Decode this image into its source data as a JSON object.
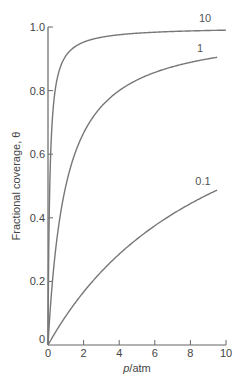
{
  "chart_data": {
    "type": "line",
    "title": "",
    "xlabel": "p/atm",
    "xlabel_italic_part": "p",
    "xlabel_rest": "/atm",
    "ylabel": "Fractional coverage, θ",
    "xlim": [
      0,
      10
    ],
    "ylim": [
      0,
      1.0
    ],
    "grid": false,
    "legend": "inline curve labels",
    "x_ticks": [
      0,
      2,
      4,
      6,
      8,
      10
    ],
    "x_tick_labels": [
      "0",
      "2",
      "4",
      "6",
      "8",
      "10"
    ],
    "y_ticks": [
      0,
      0.2,
      0.4,
      0.6,
      0.8,
      1.0
    ],
    "y_tick_labels": [
      "0",
      "0.2",
      "0.4",
      "0.6",
      "0.8",
      "1.0"
    ],
    "model": "theta = K*p/(1+K*p)",
    "series": [
      {
        "name": "10",
        "K": 10,
        "x": [
          0,
          0.1,
          0.2,
          0.5,
          1,
          2,
          4,
          6,
          8,
          10
        ],
        "values": [
          0,
          0.5,
          0.667,
          0.833,
          0.909,
          0.952,
          0.976,
          0.984,
          0.988,
          0.99
        ]
      },
      {
        "name": "1",
        "K": 1,
        "x": [
          0,
          0.5,
          1,
          2,
          4,
          6,
          8,
          9.5
        ],
        "values": [
          0,
          0.333,
          0.5,
          0.667,
          0.8,
          0.857,
          0.889,
          0.905
        ]
      },
      {
        "name": "0.1",
        "K": 0.1,
        "x": [
          0,
          1,
          2,
          4,
          6,
          8,
          9.5
        ],
        "values": [
          0,
          0.091,
          0.167,
          0.286,
          0.375,
          0.444,
          0.487
        ]
      }
    ]
  },
  "colors": {
    "axis": "#666666",
    "curve": "#777777",
    "text": "#444444"
  }
}
